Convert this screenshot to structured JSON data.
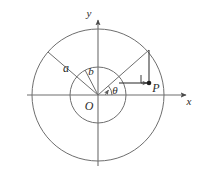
{
  "figure": {
    "background_color": "#ffffff",
    "stroke_color": "#6e6e6e",
    "label_color": "#2b2b2b",
    "origin": {
      "x": 98,
      "y": 95,
      "label": "O"
    },
    "axes": {
      "x_axis": {
        "label": "x",
        "from_x": 27,
        "to_x": 188,
        "y": 95,
        "arrow": true
      },
      "y_axis": {
        "label": "y",
        "x": 98,
        "from_y": 166,
        "to_y": 18,
        "arrow": true
      }
    },
    "circles": [
      {
        "name": "outer-circle",
        "radius_label": "a",
        "radius_px": 66,
        "cx": 98,
        "cy": 95
      },
      {
        "name": "inner-circle",
        "radius_label": "b",
        "radius_px": 28,
        "cx": 98,
        "cy": 95
      }
    ],
    "radii": [
      {
        "name": "radius-a",
        "label": "a",
        "label_x": 66,
        "label_y": 70,
        "angle_deg": 139,
        "to_x": 48,
        "to_y": 52
      },
      {
        "name": "radius-b",
        "label": "b",
        "label_x": 90,
        "label_y": 73,
        "angle_deg": 118,
        "to_x": 85,
        "to_y": 70
      }
    ],
    "ray": {
      "name": "terminal-ray",
      "angle_label": "θ",
      "angle_label_x": 113,
      "angle_label_y": 94,
      "outer_point": {
        "x": 149,
        "y": 50
      },
      "inner_point": {
        "x": 120,
        "y": 83
      }
    },
    "point_p": {
      "label": "P",
      "x": 149,
      "y": 83,
      "dot_radius": 2.2,
      "label_offset_x": 6,
      "label_offset_y": 10
    },
    "right_angle_mark": {
      "x": 141,
      "y": 75,
      "size": 8
    },
    "construction_lines": [
      {
        "name": "vertical-drop",
        "from_x": 149,
        "from_y": 50,
        "to_x": 149,
        "to_y": 83
      },
      {
        "name": "horizontal-to-p",
        "from_x": 120,
        "from_y": 83,
        "to_x": 149,
        "to_y": 83,
        "arrow": true
      }
    ]
  }
}
